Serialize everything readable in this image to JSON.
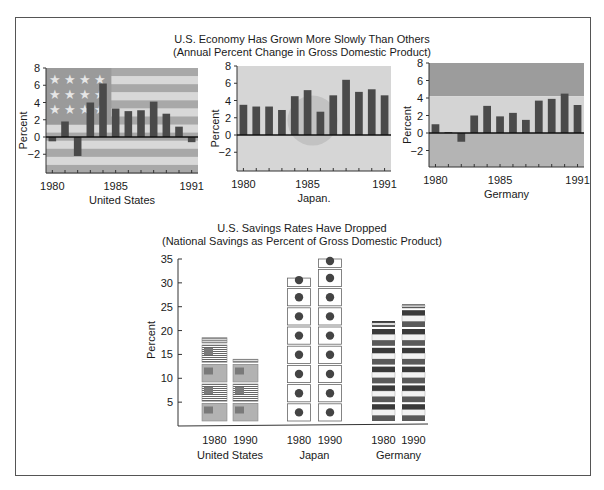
{
  "top_title": {
    "line1": "U.S. Economy Has Grown More Slowly Than Others",
    "line2": "(Annual Percent Change in Gross Domestic Product)"
  },
  "bottom_title": {
    "line1": "U.S. Savings Rates Have Dropped",
    "line2": "(National Savings as Percent of Gross Domestic Product)"
  },
  "colors": {
    "bar": "#4a4a4a",
    "us_dark": "#a8a8a8",
    "us_light": "#d8d8d8",
    "us_canton": "#9a9a9a",
    "japan_bg": "#d6d6d6",
    "japan_circle": "#c2c2c2",
    "germany_top": "#9c9c9c",
    "germany_mid": "#d4d4d4",
    "germany_bottom": "#b4b4b4",
    "flag_dot": "#444444"
  },
  "chart_data": [
    {
      "type": "bar",
      "title": "United States",
      "xlabel": "United States",
      "ylabel": "Percent",
      "ylim": [
        -4,
        8
      ],
      "yticks": [
        8,
        6,
        4,
        2,
        0,
        -2
      ],
      "xtick_labels": [
        "1980",
        "1985",
        "1991"
      ],
      "categories": [
        "1980",
        "1981",
        "1982",
        "1983",
        "1984",
        "1985",
        "1986",
        "1987",
        "1988",
        "1989",
        "1990",
        "1991"
      ],
      "values": [
        -0.5,
        1.8,
        -2.2,
        4.0,
        6.2,
        3.3,
        3.0,
        3.1,
        4.1,
        2.7,
        1.2,
        -0.6
      ],
      "background": "U.S. flag"
    },
    {
      "type": "bar",
      "title": "Japan.",
      "xlabel": "Japan.",
      "ylabel": "Percent",
      "ylim": [
        -4,
        8
      ],
      "yticks": [
        8,
        6,
        4,
        2,
        0,
        -2
      ],
      "xtick_labels": [
        "1980",
        "1985",
        "1991"
      ],
      "categories": [
        "1980",
        "1981",
        "1982",
        "1983",
        "1984",
        "1985",
        "1986",
        "1987",
        "1988",
        "1989",
        "1990",
        "1991"
      ],
      "values": [
        3.5,
        3.3,
        3.3,
        2.9,
        4.5,
        5.2,
        2.7,
        4.6,
        6.4,
        5.0,
        5.3,
        4.6
      ],
      "background": "Japanese flag"
    },
    {
      "type": "bar",
      "title": "Germany",
      "xlabel": "Germany",
      "ylabel": "Percent",
      "ylim": [
        -4,
        8
      ],
      "yticks": [
        8,
        6,
        4,
        2,
        0,
        -2
      ],
      "xtick_labels": [
        "1980",
        "1985",
        "1991"
      ],
      "categories": [
        "1980",
        "1981",
        "1982",
        "1983",
        "1984",
        "1985",
        "1986",
        "1987",
        "1988",
        "1989",
        "1990",
        "1991"
      ],
      "values": [
        1.0,
        0.1,
        -1.0,
        2.0,
        3.1,
        1.9,
        2.3,
        1.5,
        3.7,
        3.9,
        4.5,
        3.2
      ],
      "background": "German flag"
    },
    {
      "type": "bar",
      "title": "U.S. Savings Rates Have Dropped",
      "subtitle": "(National Savings as Percent of Gross Domestic Product)",
      "ylabel": "Percent",
      "ylim": [
        0,
        35
      ],
      "yticks": [
        35,
        30,
        25,
        20,
        15,
        10,
        5
      ],
      "groups": [
        "United States",
        "Japan",
        "Germany"
      ],
      "categories": [
        "1980",
        "1990"
      ],
      "series": [
        {
          "name": "United States",
          "values": [
            18.5,
            14.0
          ]
        },
        {
          "name": "Japan",
          "values": [
            31.0,
            35.0
          ]
        },
        {
          "name": "Germany",
          "values": [
            22.0,
            25.5
          ]
        }
      ],
      "style": "pictogram (stacked national flags)"
    }
  ]
}
